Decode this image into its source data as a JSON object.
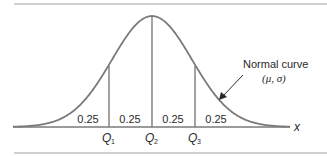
{
  "figure": {
    "annotation": {
      "title": "Normal curve",
      "params": "(μ, σ)"
    },
    "axis_label": "x",
    "areas": [
      "0.25",
      "0.25",
      "0.25",
      "0.25"
    ],
    "quartiles": [
      {
        "letter": "Q",
        "sub": "1"
      },
      {
        "letter": "Q",
        "sub": "2"
      },
      {
        "letter": "Q",
        "sub": "3"
      }
    ],
    "colors": {
      "curve": "#7a7a7a",
      "rule": "#cfcfcf",
      "text": "#2a2a2a"
    }
  }
}
